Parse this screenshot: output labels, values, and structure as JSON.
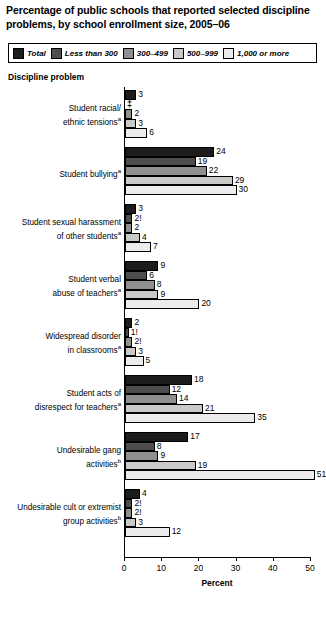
{
  "title": "Percentage of public schools that reported selected discipline problems, by school enrollment size, 2005–06",
  "axis_heading": "Discipline problem",
  "legend": {
    "items": [
      {
        "label": "Total",
        "color": "#1c1c1c"
      },
      {
        "label": "Less than 300",
        "color": "#4d4d4d"
      },
      {
        "label": "300–499",
        "color": "#8f8f8f"
      },
      {
        "label": "500–999",
        "color": "#c9c9c9"
      },
      {
        "label": "1,000 or more",
        "color": "#ececec"
      }
    ]
  },
  "chart_data": {
    "type": "bar",
    "title": "Percentage of public schools that reported selected discipline problems, by school enrollment size, 2005–06",
    "xlabel": "Percent",
    "ylabel": "Discipline problem",
    "xlim": [
      0,
      50
    ],
    "xticks": [
      0,
      10,
      20,
      30,
      40,
      50
    ],
    "grid": false,
    "legend_position": "top",
    "orientation": "horizontal",
    "series": [
      {
        "name": "Total",
        "color": "#1c1c1c",
        "values": [
          3,
          24,
          3,
          9,
          2,
          18,
          17,
          4
        ],
        "labels": [
          "3",
          "24",
          "3",
          "9",
          "2",
          "18",
          "17",
          "4"
        ]
      },
      {
        "name": "Less than 300",
        "color": "#4d4d4d",
        "values": [
          null,
          19,
          2,
          6,
          1,
          12,
          8,
          2
        ],
        "labels": [
          "‡",
          "19",
          "2!",
          "6",
          "1!",
          "12",
          "8",
          "2!"
        ]
      },
      {
        "name": "300–499",
        "color": "#8f8f8f",
        "values": [
          2,
          22,
          2,
          8,
          2,
          14,
          9,
          2
        ],
        "labels": [
          "2",
          "22",
          "2",
          "8",
          "2!",
          "14",
          "9",
          "2!"
        ]
      },
      {
        "name": "500–999",
        "color": "#c9c9c9",
        "values": [
          3,
          29,
          4,
          9,
          3,
          21,
          19,
          3
        ],
        "labels": [
          "3",
          "29",
          "4",
          "9",
          "3",
          "21",
          "19",
          "3"
        ]
      },
      {
        "name": "1,000 or more",
        "color": "#ececec",
        "values": [
          6,
          30,
          7,
          20,
          5,
          35,
          51,
          12
        ],
        "labels": [
          "6",
          "30",
          "7",
          "20",
          "5",
          "35",
          "51",
          "12"
        ]
      }
    ],
    "categories": [
      "Student racial/ethnic tensions",
      "Student bullying",
      "Student sexual harassment of other students",
      "Student verbal abuse of teachers",
      "Widespread disorder in classrooms",
      "Student acts of disrespect for teachers",
      "Undesirable gang activities",
      "Undesirable cult or extremist group activities"
    ]
  },
  "groups": [
    {
      "label_lines": [
        "Student racial/",
        "ethnic tensions"
      ],
      "footnote": "a",
      "bars": [
        {
          "series": "Total",
          "value": 3,
          "label": "3",
          "color": "#1c1c1c",
          "suppressed": false
        },
        {
          "series": "Less than 300",
          "value": 0,
          "label": "‡",
          "color": "#4d4d4d",
          "suppressed": true
        },
        {
          "series": "300–499",
          "value": 2,
          "label": "2",
          "color": "#8f8f8f",
          "suppressed": false
        },
        {
          "series": "500–999",
          "value": 3,
          "label": "3",
          "color": "#c9c9c9",
          "suppressed": false
        },
        {
          "series": "1,000 or more",
          "value": 6,
          "label": "6",
          "color": "#ececec",
          "suppressed": false
        }
      ]
    },
    {
      "label_lines": [
        "Student bullying"
      ],
      "footnote": "a",
      "bars": [
        {
          "series": "Total",
          "value": 24,
          "label": "24",
          "color": "#1c1c1c",
          "suppressed": false
        },
        {
          "series": "Less than 300",
          "value": 19,
          "label": "19",
          "color": "#4d4d4d",
          "suppressed": false
        },
        {
          "series": "300–499",
          "value": 22,
          "label": "22",
          "color": "#8f8f8f",
          "suppressed": false
        },
        {
          "series": "500–999",
          "value": 29,
          "label": "29",
          "color": "#c9c9c9",
          "suppressed": false
        },
        {
          "series": "1,000 or more",
          "value": 30,
          "label": "30",
          "color": "#ececec",
          "suppressed": false
        }
      ]
    },
    {
      "label_lines": [
        "Student sexual harassment",
        "of other students"
      ],
      "footnote": "a",
      "bars": [
        {
          "series": "Total",
          "value": 3,
          "label": "3",
          "color": "#1c1c1c",
          "suppressed": false
        },
        {
          "series": "Less than 300",
          "value": 2,
          "label": "2!",
          "color": "#4d4d4d",
          "suppressed": false
        },
        {
          "series": "300–499",
          "value": 2,
          "label": "2",
          "color": "#8f8f8f",
          "suppressed": false
        },
        {
          "series": "500–999",
          "value": 4,
          "label": "4",
          "color": "#c9c9c9",
          "suppressed": false
        },
        {
          "series": "1,000 or more",
          "value": 7,
          "label": "7",
          "color": "#ececec",
          "suppressed": false
        }
      ]
    },
    {
      "label_lines": [
        "Student verbal",
        "abuse of teachers"
      ],
      "footnote": "a",
      "bars": [
        {
          "series": "Total",
          "value": 9,
          "label": "9",
          "color": "#1c1c1c",
          "suppressed": false
        },
        {
          "series": "Less than 300",
          "value": 6,
          "label": "6",
          "color": "#4d4d4d",
          "suppressed": false
        },
        {
          "series": "300–499",
          "value": 8,
          "label": "8",
          "color": "#8f8f8f",
          "suppressed": false
        },
        {
          "series": "500–999",
          "value": 9,
          "label": "9",
          "color": "#c9c9c9",
          "suppressed": false
        },
        {
          "series": "1,000 or more",
          "value": 20,
          "label": "20",
          "color": "#ececec",
          "suppressed": false
        }
      ]
    },
    {
      "label_lines": [
        "Widespread disorder",
        "in classrooms"
      ],
      "footnote": "a",
      "bars": [
        {
          "series": "Total",
          "value": 2,
          "label": "2",
          "color": "#1c1c1c",
          "suppressed": false
        },
        {
          "series": "Less than 300",
          "value": 1,
          "label": "1!",
          "color": "#4d4d4d",
          "suppressed": false
        },
        {
          "series": "300–499",
          "value": 2,
          "label": "2!",
          "color": "#8f8f8f",
          "suppressed": false
        },
        {
          "series": "500–999",
          "value": 3,
          "label": "3",
          "color": "#c9c9c9",
          "suppressed": false
        },
        {
          "series": "1,000 or more",
          "value": 5,
          "label": "5",
          "color": "#ececec",
          "suppressed": false
        }
      ]
    },
    {
      "label_lines": [
        "Student acts of",
        "disrespect for teachers"
      ],
      "footnote": "a",
      "bars": [
        {
          "series": "Total",
          "value": 18,
          "label": "18",
          "color": "#1c1c1c",
          "suppressed": false
        },
        {
          "series": "Less than 300",
          "value": 12,
          "label": "12",
          "color": "#4d4d4d",
          "suppressed": false
        },
        {
          "series": "300–499",
          "value": 14,
          "label": "14",
          "color": "#8f8f8f",
          "suppressed": false
        },
        {
          "series": "500–999",
          "value": 21,
          "label": "21",
          "color": "#c9c9c9",
          "suppressed": false
        },
        {
          "series": "1,000 or more",
          "value": 35,
          "label": "35",
          "color": "#ececec",
          "suppressed": false
        }
      ]
    },
    {
      "label_lines": [
        "Undesirable gang",
        "activities"
      ],
      "footnote": "b",
      "bars": [
        {
          "series": "Total",
          "value": 17,
          "label": "17",
          "color": "#1c1c1c",
          "suppressed": false
        },
        {
          "series": "Less than 300",
          "value": 8,
          "label": "8",
          "color": "#4d4d4d",
          "suppressed": false
        },
        {
          "series": "300–499",
          "value": 9,
          "label": "9",
          "color": "#8f8f8f",
          "suppressed": false
        },
        {
          "series": "500–999",
          "value": 19,
          "label": "19",
          "color": "#c9c9c9",
          "suppressed": false
        },
        {
          "series": "1,000 or more",
          "value": 51,
          "label": "51",
          "color": "#ececec",
          "suppressed": false
        }
      ]
    },
    {
      "label_lines": [
        "Undesirable cult or extremist",
        "group activities"
      ],
      "footnote": "b",
      "bars": [
        {
          "series": "Total",
          "value": 4,
          "label": "4",
          "color": "#1c1c1c",
          "suppressed": false
        },
        {
          "series": "Less than 300",
          "value": 2,
          "label": "2!",
          "color": "#4d4d4d",
          "suppressed": false
        },
        {
          "series": "300–499",
          "value": 2,
          "label": "2!",
          "color": "#8f8f8f",
          "suppressed": false
        },
        {
          "series": "500–999",
          "value": 3,
          "label": "3",
          "color": "#c9c9c9",
          "suppressed": false
        },
        {
          "series": "1,000 or more",
          "value": 12,
          "label": "12",
          "color": "#ececec",
          "suppressed": false
        }
      ]
    }
  ],
  "xaxis": {
    "ticks": [
      "0",
      "10",
      "20",
      "30",
      "40",
      "50"
    ],
    "title": "Percent"
  }
}
